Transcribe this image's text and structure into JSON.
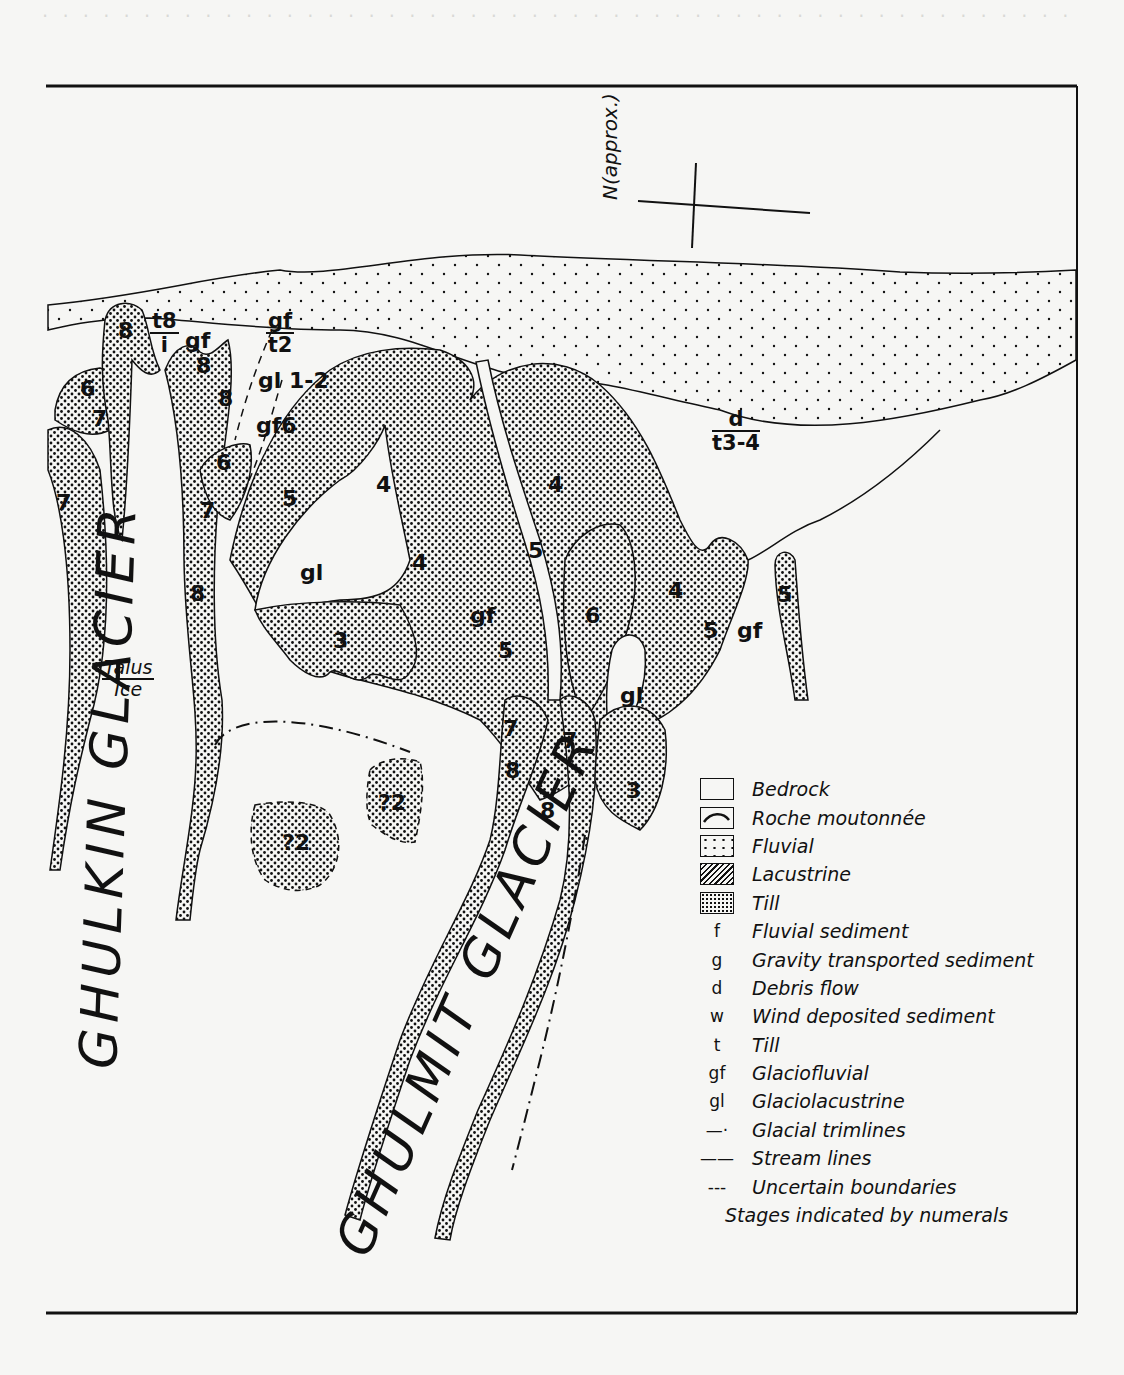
{
  "figure": {
    "north_arrow": {
      "label": "N(approx.)"
    },
    "glaciers": [
      {
        "name": "GHULKIN GLACIER"
      },
      {
        "name": "GHULMIT GLACIER"
      }
    ],
    "annotations": {
      "talus_ice": {
        "top": "Talus",
        "bottom": "Ice"
      },
      "fractions": [
        {
          "id": "t8-i",
          "top": "t8",
          "bottom": "i"
        },
        {
          "id": "gf-t2",
          "top": "gf",
          "bottom": "t2"
        },
        {
          "id": "d-t3-4",
          "top": "d",
          "bottom": "t3-4"
        }
      ],
      "map_labels": [
        "8",
        "6",
        "7",
        "gf",
        "8",
        "8",
        "gl 1-2",
        "gf6",
        "6",
        "7",
        "7",
        "8",
        "5",
        "4",
        "4",
        "4",
        "5",
        "gl",
        "3",
        "gf",
        "5",
        "6",
        "gl",
        "4",
        "5",
        "gf",
        "5",
        "7",
        "8",
        "7",
        "8",
        "3",
        "?2",
        "?2"
      ]
    },
    "legend": {
      "items": [
        {
          "code": "",
          "swatch": "blank",
          "label": "Bedrock"
        },
        {
          "code": "",
          "swatch": "arc",
          "label": "Roche moutonnée"
        },
        {
          "code": "",
          "swatch": "sparse-dots",
          "label": "Fluvial"
        },
        {
          "code": "",
          "swatch": "hatch",
          "label": "Lacustrine"
        },
        {
          "code": "",
          "swatch": "dense-dots",
          "label": "Till"
        },
        {
          "code": "f",
          "swatch": "",
          "label": "Fluvial sediment"
        },
        {
          "code": "g",
          "swatch": "",
          "label": "Gravity transported sediment"
        },
        {
          "code": "d",
          "swatch": "",
          "label": "Debris flow"
        },
        {
          "code": "w",
          "swatch": "",
          "label": "Wind deposited sediment"
        },
        {
          "code": "t",
          "swatch": "",
          "label": "Till"
        },
        {
          "code": "gf",
          "swatch": "",
          "label": "Glaciofluvial"
        },
        {
          "code": "gl",
          "swatch": "",
          "label": "Glaciolacustrine"
        },
        {
          "code": "—·",
          "swatch": "",
          "label": "Glacial trimlines"
        },
        {
          "code": "——",
          "swatch": "",
          "label": "Stream lines"
        },
        {
          "code": "---",
          "swatch": "",
          "label": "Uncertain boundaries"
        }
      ],
      "note": "Stages indicated by numerals"
    }
  },
  "colors": {
    "ink": "#111111",
    "paper": "#f6f6f4",
    "bleed": "#d9d9d6"
  }
}
